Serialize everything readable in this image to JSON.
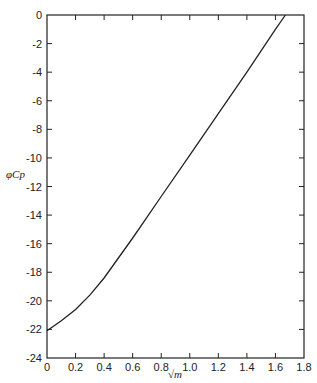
{
  "chart_data": {
    "type": "line",
    "title": "",
    "xlabel": "√m",
    "ylabel": "φCp",
    "xlim": [
      0,
      1.8
    ],
    "ylim": [
      -24,
      0
    ],
    "xticks": [
      "0",
      "0.2",
      "0.4",
      "0.6",
      "0.8",
      "1.0",
      "1.2",
      "1.4",
      "1.6",
      "1.8"
    ],
    "yticks": [
      "0",
      "-2",
      "-4",
      "-6",
      "-8",
      "-10",
      "-12",
      "-14",
      "-16",
      "-18",
      "-20",
      "-22",
      "-24"
    ],
    "grid": false,
    "legend": null,
    "series": [
      {
        "name": "φCp",
        "x": [
          0,
          0.1,
          0.2,
          0.3,
          0.4,
          0.5,
          0.6,
          0.8,
          1.0,
          1.2,
          1.4,
          1.6,
          1.67
        ],
        "y": [
          -22.1,
          -21.4,
          -20.6,
          -19.6,
          -18.4,
          -17.0,
          -15.6,
          -12.7,
          -9.8,
          -6.9,
          -4.0,
          -1.0,
          0.0
        ]
      }
    ]
  }
}
